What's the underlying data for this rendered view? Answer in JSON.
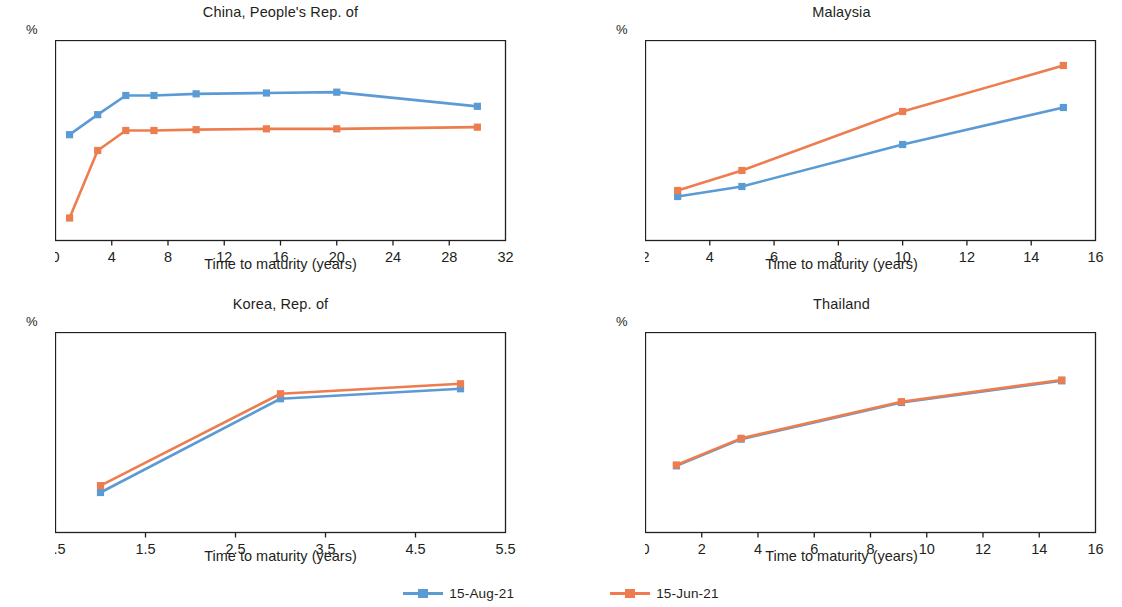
{
  "colors": {
    "series_aug": "#5B9BD5",
    "series_jun": "#ED7D4E",
    "axis": "#231f20",
    "background": "#ffffff"
  },
  "legend": {
    "position": "bottom-center",
    "items": [
      {
        "label": "15-Aug-21",
        "color": "#5B9BD5",
        "marker": "square"
      },
      {
        "label": "15-Jun-21",
        "color": "#ED7D4E",
        "marker": "square"
      }
    ]
  },
  "common": {
    "xlabel": "Time to maturity (years)",
    "unit_symbol": "%"
  },
  "chart_data": [
    {
      "type": "line",
      "title": "China, People's Rep. of",
      "xlabel": "Time to maturity (years)",
      "ylabel": "%",
      "xlim": [
        0,
        32
      ],
      "ylim": [
        10.8,
        13.2
      ],
      "xticks": [
        0,
        4,
        8,
        12,
        16,
        20,
        24,
        28,
        32
      ],
      "yticks": [
        10.8,
        11.4,
        12.0,
        12.6,
        13.2
      ],
      "ytick_labels": [
        "10.8",
        "11.4",
        "12.0",
        "12.6",
        "13.2"
      ],
      "grid": false,
      "series": [
        {
          "name": "15-Aug-21",
          "color": "#5B9BD5",
          "x": [
            1,
            3,
            5,
            7,
            10,
            15,
            20,
            30
          ],
          "values": [
            12.07,
            12.31,
            12.54,
            12.54,
            12.56,
            12.57,
            12.58,
            12.41
          ]
        },
        {
          "name": "15-Jun-21",
          "color": "#ED7D4E",
          "x": [
            1,
            3,
            5,
            7,
            10,
            15,
            20,
            30
          ],
          "values": [
            11.07,
            11.88,
            12.12,
            12.12,
            12.13,
            12.14,
            12.14,
            12.16
          ]
        }
      ]
    },
    {
      "type": "line",
      "title": "Malaysia",
      "xlabel": "Time to maturity (years)",
      "ylabel": "%",
      "xlim": [
        2,
        16
      ],
      "ylim": [
        2.5,
        4.5
      ],
      "xticks": [
        2,
        4,
        6,
        8,
        10,
        12,
        14,
        16
      ],
      "yticks": [
        2.5,
        3.0,
        3.5,
        4.0,
        4.5
      ],
      "ytick_labels": [
        "2.5",
        "3.0",
        "3.5",
        "4.0",
        "4.5"
      ],
      "grid": false,
      "series": [
        {
          "name": "15-Aug-21",
          "color": "#5B9BD5",
          "x": [
            3,
            5,
            10,
            15
          ],
          "values": [
            2.94,
            3.04,
            3.46,
            3.83
          ]
        },
        {
          "name": "15-Jun-21",
          "color": "#ED7D4E",
          "x": [
            3,
            5,
            10,
            15
          ],
          "values": [
            3.0,
            3.2,
            3.79,
            4.25
          ]
        }
      ]
    },
    {
      "type": "line",
      "title": "Korea, Rep. of",
      "xlabel": "Time to maturity (years)",
      "ylabel": "%",
      "xlim": [
        0.5,
        5.5
      ],
      "ylim": [
        1.5,
        4.7
      ],
      "xticks": [
        0.5,
        1.5,
        2.5,
        3.5,
        4.5,
        5.5
      ],
      "xtick_labels": [
        "0.5",
        "1.5",
        "2.5",
        "3.5",
        "4.5",
        "5.5"
      ],
      "yticks": [
        1.5,
        2.3,
        3.1,
        3.9,
        4.7
      ],
      "ytick_labels": [
        "1.5",
        "2.3",
        "3.1",
        "3.9",
        "4.7"
      ],
      "grid": false,
      "series": [
        {
          "name": "15-Aug-21",
          "color": "#5B9BD5",
          "x": [
            1,
            3,
            5
          ],
          "values": [
            2.14,
            3.64,
            3.8
          ]
        },
        {
          "name": "15-Jun-21",
          "color": "#ED7D4E",
          "x": [
            1,
            3,
            5
          ],
          "values": [
            2.25,
            3.72,
            3.88
          ]
        }
      ]
    },
    {
      "type": "line",
      "title": "Thailand",
      "xlabel": "Time to maturity (years)",
      "ylabel": "%",
      "xlim": [
        0,
        16
      ],
      "ylim": [
        2.3,
        3.5
      ],
      "xticks": [
        0,
        2,
        4,
        6,
        8,
        10,
        12,
        14,
        16
      ],
      "yticks": [
        2.3,
        2.6,
        2.9,
        3.2,
        3.5
      ],
      "ytick_labels": [
        "2.3",
        "2.6",
        "2.9",
        "3.2",
        "3.5"
      ],
      "grid": false,
      "series": [
        {
          "name": "15-Aug-21",
          "color": "#5B9BD5",
          "x": [
            1.1,
            3.4,
            9.1,
            14.8
          ],
          "values": [
            2.7,
            2.86,
            3.08,
            3.21
          ]
        },
        {
          "name": "15-Jun-21",
          "color": "#ED7D4E",
          "x": [
            1.1,
            3.4,
            9.1,
            14.8
          ],
          "values": [
            2.705,
            2.865,
            3.085,
            3.215
          ]
        }
      ]
    }
  ]
}
